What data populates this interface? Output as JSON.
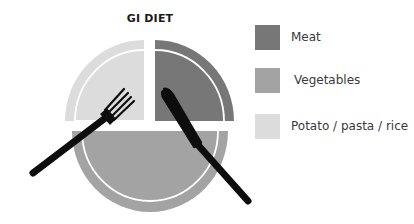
{
  "title": "GI DIET",
  "colors": {
    "meat": "#777777",
    "vegetables": "#a3a3a3",
    "potato": "#dcdcdc",
    "utensil": "#0d0d0d",
    "background": "#ffffff"
  },
  "legend": [
    {
      "label": "Meat",
      "color": "#777777",
      "top": 24,
      "label_offset": 0
    },
    {
      "label": "Vegetables",
      "color": "#a3a3a3",
      "top": 67,
      "label_offset": 3
    },
    {
      "label": "Potato / pasta / rice",
      "color": "#dcdcdc",
      "top": 113,
      "label_offset": 0
    }
  ],
  "plate": {
    "sections": [
      {
        "name": "Potato / pasta / rice",
        "portion": "quarter",
        "position": "top-left"
      },
      {
        "name": "Meat",
        "portion": "quarter",
        "position": "top-right"
      },
      {
        "name": "Vegetables",
        "portion": "half",
        "position": "bottom"
      }
    ],
    "utensils": [
      "fork",
      "knife"
    ]
  }
}
